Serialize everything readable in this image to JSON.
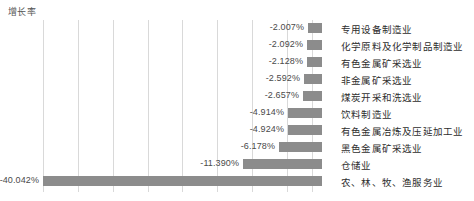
{
  "chart_data": {
    "type": "bar",
    "orientation": "horizontal",
    "title": "增长率",
    "xlabel": "",
    "ylabel": "",
    "grid": true,
    "legend": "none",
    "bar_color": "#8c8c8c",
    "gridline_color": "#d9d9d9",
    "xlim": [
      -45,
      0
    ],
    "zero_baseline_px": 322,
    "gridline_values": [
      -40.0,
      -35.0,
      -30.0,
      -25.0,
      -20.0,
      -15.0,
      -10.0,
      -5.0,
      -1.5
    ],
    "categories": [
      "专用设备制造业",
      "化学原料及化学制品制造业",
      "有色金属矿采选业",
      "非金属矿采选业",
      "煤炭开采和洗选业",
      "饮料制造业",
      "有色金属冶炼及压延加工业",
      "黑色金属矿采选业",
      "仓储业",
      "农、林、牧、渔服务业"
    ],
    "values": [
      -2.007,
      -2.092,
      -2.128,
      -2.592,
      -2.657,
      -4.914,
      -4.924,
      -6.178,
      -11.39,
      -40.042
    ],
    "value_labels": [
      "-2.007%",
      "-2.092%",
      "-2.128%",
      "-2.592%",
      "-2.657%",
      "-4.914%",
      "-4.924%",
      "-6.178%",
      "-11.390%",
      "-40.042%"
    ]
  }
}
